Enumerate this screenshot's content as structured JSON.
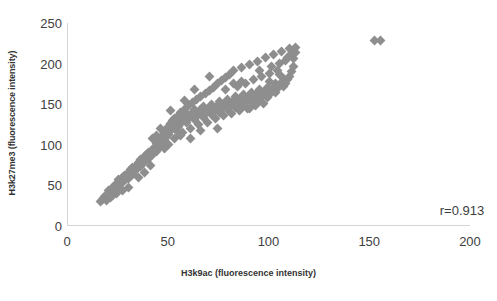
{
  "chart_data": {
    "type": "scatter",
    "title": "",
    "xlabel": "H3k9ac (fluorescence intensity)",
    "ylabel": "H3k27me3 (fluorescence intensity)",
    "xlim": [
      0,
      200
    ],
    "ylim": [
      0,
      250
    ],
    "xticks": [
      0,
      50,
      100,
      150,
      200
    ],
    "yticks": [
      0,
      50,
      100,
      150,
      200,
      250
    ],
    "grid": false,
    "legend": null,
    "marker": {
      "shape": "diamond",
      "color": "#8e8e8e",
      "size": 7
    },
    "annotations": [
      {
        "name": "correlation-coefficient",
        "text": "r=0.913",
        "x": 185,
        "y": 18
      }
    ],
    "series": [
      {
        "name": "samples",
        "points": [
          [
            16,
            30
          ],
          [
            17,
            33
          ],
          [
            18,
            36
          ],
          [
            19,
            31
          ],
          [
            20,
            39
          ],
          [
            20,
            44
          ],
          [
            21,
            42
          ],
          [
            22,
            48
          ],
          [
            22,
            38
          ],
          [
            23,
            45
          ],
          [
            24,
            52
          ],
          [
            25,
            50
          ],
          [
            25,
            57
          ],
          [
            26,
            55
          ],
          [
            27,
            60
          ],
          [
            27,
            53
          ],
          [
            28,
            62
          ],
          [
            29,
            58
          ],
          [
            30,
            66
          ],
          [
            30,
            59
          ],
          [
            31,
            70
          ],
          [
            32,
            64
          ],
          [
            32,
            72
          ],
          [
            33,
            68
          ],
          [
            34,
            75
          ],
          [
            34,
            69
          ],
          [
            35,
            78
          ],
          [
            36,
            73
          ],
          [
            36,
            82
          ],
          [
            37,
            77
          ],
          [
            38,
            85
          ],
          [
            38,
            79
          ],
          [
            39,
            88
          ],
          [
            40,
            83
          ],
          [
            40,
            91
          ],
          [
            41,
            86
          ],
          [
            42,
            94
          ],
          [
            42,
            88
          ],
          [
            43,
            97
          ],
          [
            44,
            92
          ],
          [
            44,
            101
          ],
          [
            45,
            95
          ],
          [
            45,
            105
          ],
          [
            46,
            99
          ],
          [
            46,
            108
          ],
          [
            47,
            103
          ],
          [
            47,
            112
          ],
          [
            48,
            106
          ],
          [
            48,
            115
          ],
          [
            49,
            110
          ],
          [
            49,
            119
          ],
          [
            50,
            113
          ],
          [
            50,
            122
          ],
          [
            50,
            100
          ],
          [
            51,
            117
          ],
          [
            51,
            126
          ],
          [
            52,
            120
          ],
          [
            52,
            130
          ],
          [
            53,
            124
          ],
          [
            53,
            133
          ],
          [
            54,
            118
          ],
          [
            54,
            128
          ],
          [
            55,
            122
          ],
          [
            55,
            136
          ],
          [
            56,
            126
          ],
          [
            56,
            140
          ],
          [
            57,
            130
          ],
          [
            57,
            115
          ],
          [
            58,
            134
          ],
          [
            58,
            144
          ],
          [
            59,
            128
          ],
          [
            59,
            138
          ],
          [
            60,
            132
          ],
          [
            60,
            148
          ],
          [
            61,
            136
          ],
          [
            61,
            120
          ],
          [
            62,
            140
          ],
          [
            62,
            152
          ],
          [
            63,
            131
          ],
          [
            63,
            144
          ],
          [
            64,
            135
          ],
          [
            64,
            156
          ],
          [
            65,
            139
          ],
          [
            65,
            125
          ],
          [
            66,
            143
          ],
          [
            66,
            160
          ],
          [
            67,
            134
          ],
          [
            67,
            147
          ],
          [
            68,
            138
          ],
          [
            68,
            163
          ],
          [
            69,
            142
          ],
          [
            69,
            128
          ],
          [
            70,
            146
          ],
          [
            70,
            167
          ],
          [
            71,
            137
          ],
          [
            71,
            150
          ],
          [
            72,
            141
          ],
          [
            72,
            171
          ],
          [
            73,
            145
          ],
          [
            73,
            132
          ],
          [
            74,
            149
          ],
          [
            74,
            175
          ],
          [
            75,
            140
          ],
          [
            75,
            153
          ],
          [
            76,
            144
          ],
          [
            76,
            179
          ],
          [
            77,
            148
          ],
          [
            77,
            136
          ],
          [
            78,
            152
          ],
          [
            78,
            183
          ],
          [
            79,
            143
          ],
          [
            79,
            156
          ],
          [
            80,
            147
          ],
          [
            80,
            187
          ],
          [
            81,
            151
          ],
          [
            81,
            139
          ],
          [
            82,
            155
          ],
          [
            82,
            191
          ],
          [
            83,
            146
          ],
          [
            83,
            159
          ],
          [
            84,
            150
          ],
          [
            84,
            172
          ],
          [
            85,
            154
          ],
          [
            85,
            142
          ],
          [
            86,
            158
          ],
          [
            86,
            195
          ],
          [
            87,
            149
          ],
          [
            87,
            162
          ],
          [
            88,
            153
          ],
          [
            88,
            176
          ],
          [
            89,
            157
          ],
          [
            89,
            145
          ],
          [
            90,
            161
          ],
          [
            90,
            199
          ],
          [
            91,
            152
          ],
          [
            91,
            165
          ],
          [
            92,
            156
          ],
          [
            92,
            180
          ],
          [
            93,
            160
          ],
          [
            93,
            148
          ],
          [
            94,
            164
          ],
          [
            94,
            203
          ],
          [
            95,
            155
          ],
          [
            95,
            168
          ],
          [
            96,
            159
          ],
          [
            96,
            184
          ],
          [
            97,
            163
          ],
          [
            97,
            151
          ],
          [
            98,
            167
          ],
          [
            98,
            207
          ],
          [
            99,
            158
          ],
          [
            99,
            171
          ],
          [
            100,
            162
          ],
          [
            100,
            188
          ],
          [
            101,
            166
          ],
          [
            101,
            196
          ],
          [
            102,
            170
          ],
          [
            102,
            211
          ],
          [
            103,
            165
          ],
          [
            103,
            175
          ],
          [
            104,
            169
          ],
          [
            104,
            192
          ],
          [
            105,
            173
          ],
          [
            105,
            200
          ],
          [
            106,
            177
          ],
          [
            106,
            215
          ],
          [
            107,
            172
          ],
          [
            107,
            182
          ],
          [
            108,
            176
          ],
          [
            108,
            204
          ],
          [
            109,
            180
          ],
          [
            109,
            208
          ],
          [
            110,
            184
          ],
          [
            110,
            218
          ],
          [
            111,
            190
          ],
          [
            111,
            212
          ],
          [
            112,
            196
          ],
          [
            112,
            206
          ],
          [
            113,
            214
          ],
          [
            113,
            220
          ],
          [
            42,
            108
          ],
          [
            44,
            112
          ],
          [
            46,
            120
          ],
          [
            48,
            95
          ],
          [
            51,
            142
          ],
          [
            53,
            108
          ],
          [
            56,
            112
          ],
          [
            58,
            155
          ],
          [
            61,
            108
          ],
          [
            63,
            168
          ],
          [
            66,
            118
          ],
          [
            70,
            184
          ],
          [
            74,
            120
          ],
          [
            78,
            168
          ],
          [
            82,
            175
          ],
          [
            86,
            178
          ],
          [
            90,
            145
          ],
          [
            95,
            192
          ],
          [
            100,
            178
          ],
          [
            105,
            186
          ],
          [
            38,
            66
          ],
          [
            41,
            74
          ],
          [
            35,
            60
          ],
          [
            30,
            48
          ],
          [
            27,
            44
          ],
          [
            24,
            40
          ],
          [
            21,
            35
          ],
          [
            152,
            228
          ],
          [
            155,
            229
          ]
        ]
      }
    ]
  },
  "axes": {
    "y_tick_labels": [
      "250",
      "200",
      "150",
      "100",
      "50",
      "0"
    ],
    "x_tick_labels": [
      "0",
      "50",
      "100",
      "150",
      "200"
    ],
    "y_title": "H3k27me3 (fluorescence intensity)",
    "x_title": "H3k9ac (fluorescence intensity)"
  },
  "annotation": {
    "correlation": "r=0.913"
  }
}
